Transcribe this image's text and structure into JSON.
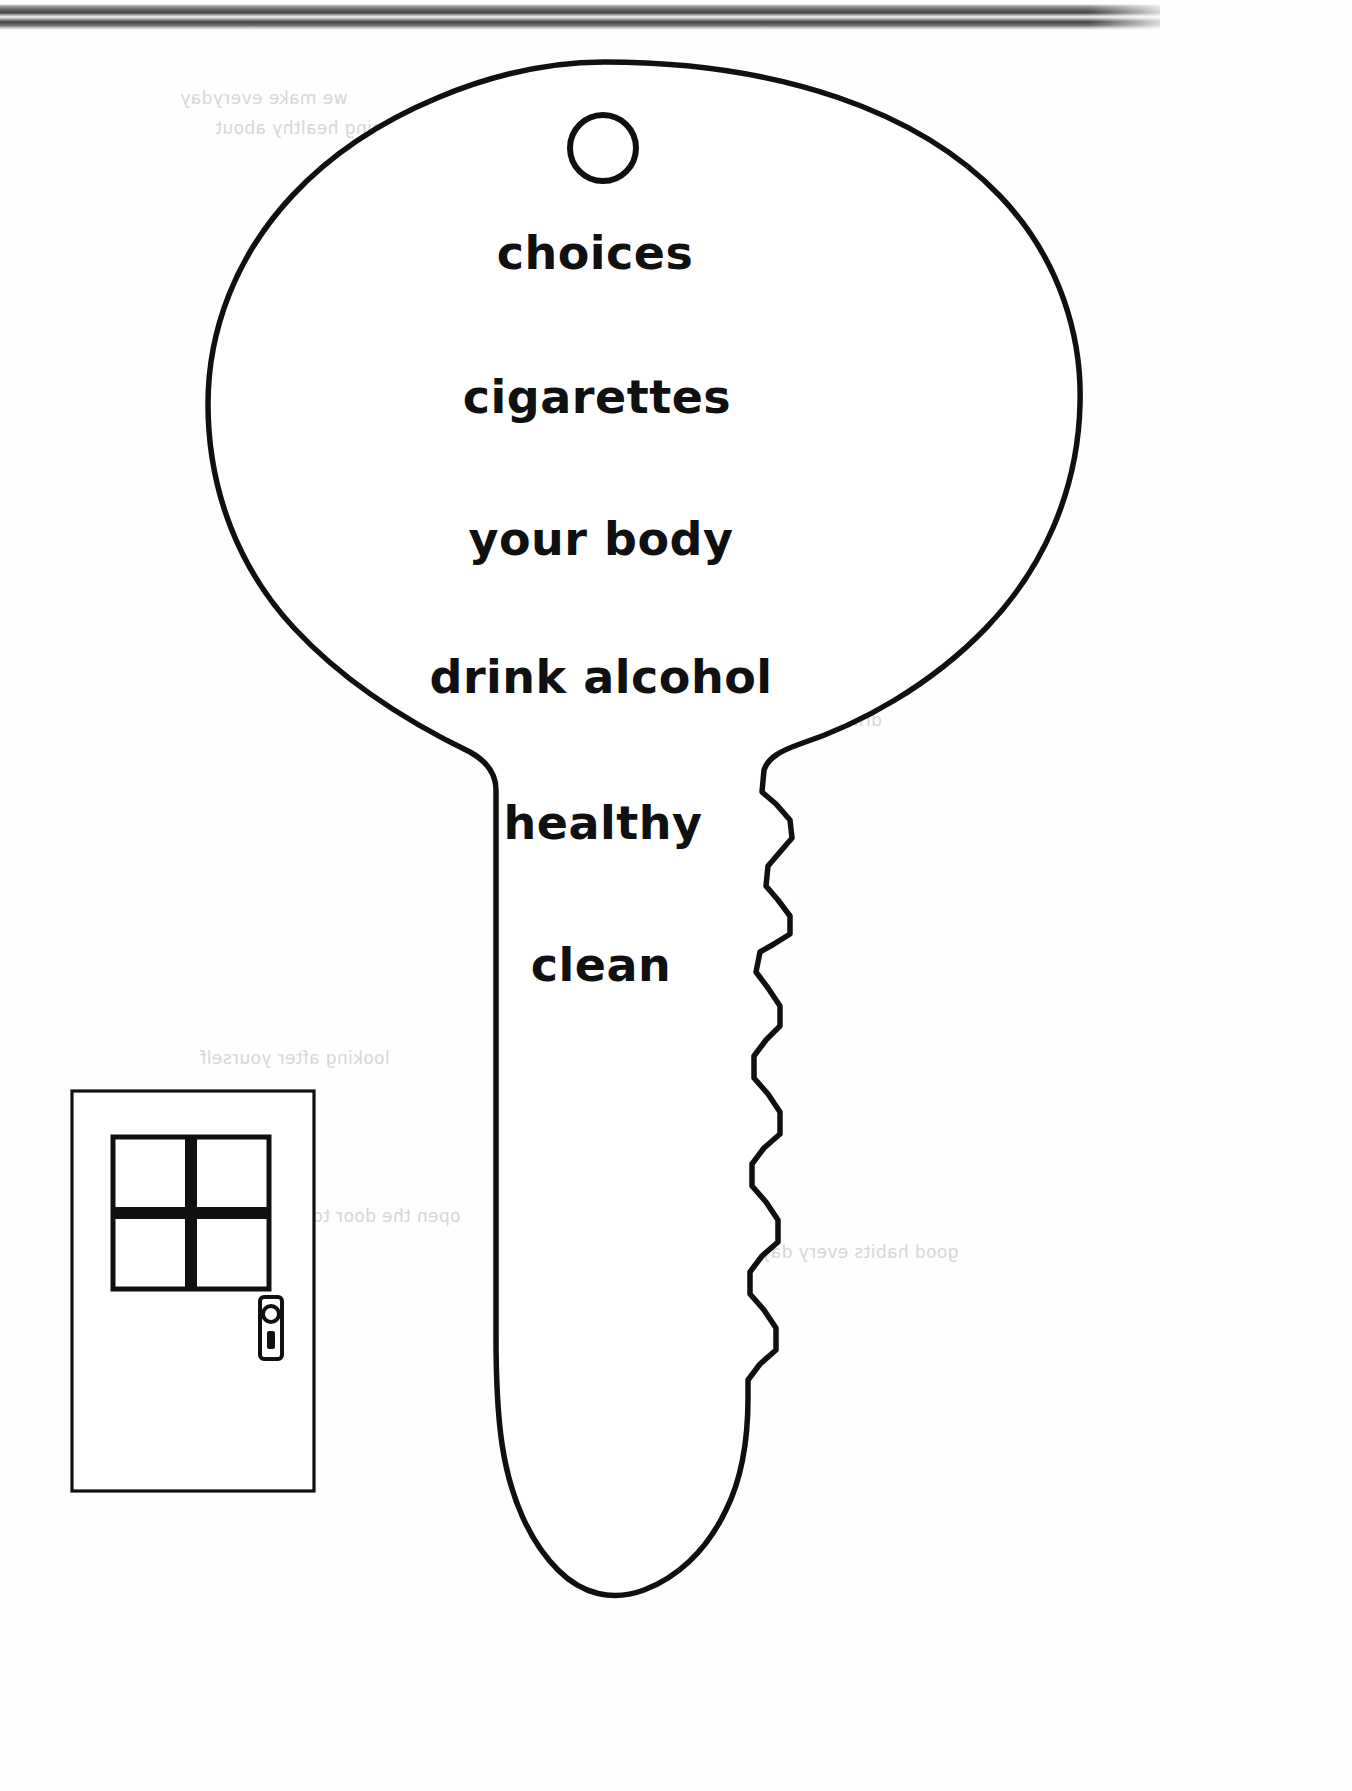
{
  "page": {
    "background_color": "#ffffff",
    "ink_color": "#101010"
  },
  "scanner_bar": {
    "name": "scanner-edge-artifact",
    "description": "grey gradient strip across top of scanned page"
  },
  "key": {
    "name": "key-outline",
    "outline_color": "#101010",
    "fill_color": "#ffffff",
    "hole": {
      "cx": 603,
      "cy": 148,
      "r": 33
    },
    "words": [
      {
        "text": "choices",
        "x": 595,
        "y": 226,
        "size": 46
      },
      {
        "text": "cigarettes",
        "x": 597,
        "y": 370,
        "size": 46
      },
      {
        "text": "your body",
        "x": 601,
        "y": 512,
        "size": 46
      },
      {
        "text": "drink alcohol",
        "x": 601,
        "y": 650,
        "size": 46
      },
      {
        "text": "healthy",
        "x": 603,
        "y": 796,
        "size": 46
      },
      {
        "text": "clean",
        "x": 601,
        "y": 938,
        "size": 46
      }
    ]
  },
  "door": {
    "name": "door-illustration",
    "outline_color": "#101010",
    "panes": 4,
    "has_handle": true
  },
  "ghost_text": [
    {
      "text": "we make everyday",
      "x": 180,
      "y": 88
    },
    {
      "text": "being healthy about",
      "x": 215,
      "y": 118
    },
    {
      "text": "the choices",
      "x": 430,
      "y": 150
    },
    {
      "text": "and how",
      "x": 560,
      "y": 182
    },
    {
      "text": "keeping clean",
      "x": 320,
      "y": 286
    },
    {
      "text": "is good for you",
      "x": 300,
      "y": 316
    },
    {
      "text": "smoking harms",
      "x": 690,
      "y": 420
    },
    {
      "text": "what you choose",
      "x": 240,
      "y": 484
    },
    {
      "text": "drinking too much",
      "x": 720,
      "y": 710
    },
    {
      "text": "looking after yourself",
      "x": 200,
      "y": 1048
    },
    {
      "text": "open the door to health",
      "x": 250,
      "y": 1206
    },
    {
      "text": "good habits every day",
      "x": 760,
      "y": 1242
    }
  ]
}
